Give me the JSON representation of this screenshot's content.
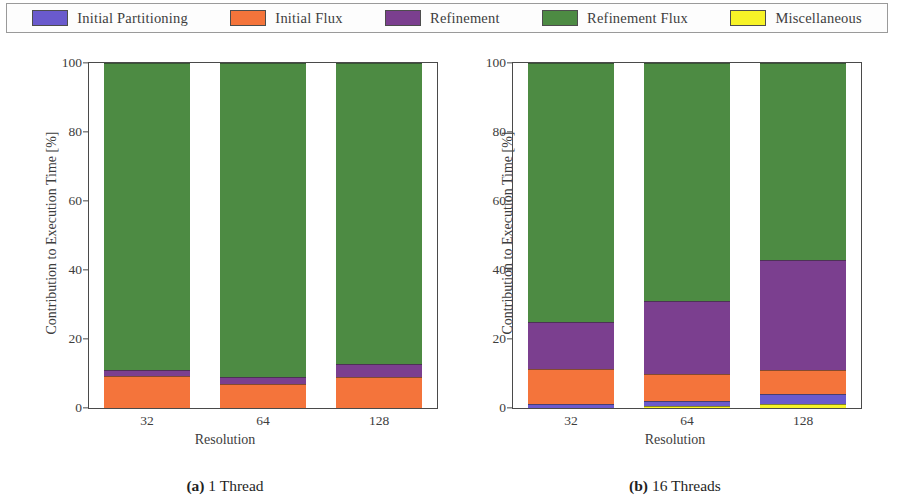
{
  "legend": {
    "items": [
      {
        "label": "Initial Partitioning",
        "color": "#6a5acd",
        "swatch_name": "legend-swatch-initial-partitioning"
      },
      {
        "label": "Initial Flux",
        "color": "#f4743b",
        "swatch_name": "legend-swatch-initial-flux"
      },
      {
        "label": "Refinement",
        "color": "#7b3f8f",
        "swatch_name": "legend-swatch-refinement"
      },
      {
        "label": "Refinement Flux",
        "color": "#4d8b43",
        "swatch_name": "legend-swatch-refinement-flux"
      },
      {
        "label": "Miscellaneous",
        "color": "#f7f327",
        "swatch_name": "legend-swatch-miscellaneous"
      }
    ]
  },
  "panels": [
    {
      "id": "a",
      "caption_tag": "(a)",
      "caption_text": "1 Thread",
      "ylabel": "Contribution to Execution Time [%]",
      "xlabel": "Resolution",
      "yticks": [
        "0",
        "20",
        "40",
        "60",
        "80",
        "100"
      ],
      "xticks": [
        "32",
        "64",
        "128"
      ]
    },
    {
      "id": "b",
      "caption_tag": "(b)",
      "caption_text": "16 Threads",
      "ylabel": "Contribution to Execution Time [%]",
      "xlabel": "Resolution",
      "yticks": [
        "0",
        "20",
        "40",
        "60",
        "80",
        "100"
      ],
      "xticks": [
        "32",
        "64",
        "128"
      ]
    }
  ],
  "chart_data": [
    {
      "type": "bar",
      "stacked": true,
      "title": "(a) 1 Thread",
      "xlabel": "Resolution",
      "ylabel": "Contribution to Execution Time [%]",
      "ylim": [
        0,
        100
      ],
      "yticks": [
        0,
        20,
        40,
        60,
        80,
        100
      ],
      "grid": false,
      "legend_position": "top",
      "categories": [
        "32",
        "64",
        "128"
      ],
      "series": [
        {
          "name": "Initial Partitioning",
          "color": "#6a5acd",
          "values": [
            0.0,
            0.0,
            0.0
          ]
        },
        {
          "name": "Initial Flux",
          "color": "#f4743b",
          "values": [
            9.2,
            6.9,
            8.9
          ]
        },
        {
          "name": "Refinement",
          "color": "#7b3f8f",
          "values": [
            1.7,
            2.0,
            3.8
          ]
        },
        {
          "name": "Refinement Flux",
          "color": "#4d8b43",
          "values": [
            89.1,
            91.1,
            87.3
          ]
        },
        {
          "name": "Miscellaneous",
          "color": "#f7f327",
          "values": [
            0.0,
            0.0,
            0.0
          ]
        }
      ]
    },
    {
      "type": "bar",
      "stacked": true,
      "title": "(b) 16 Threads",
      "xlabel": "Resolution",
      "ylabel": "Contribution to Execution Time [%]",
      "ylim": [
        0,
        100
      ],
      "yticks": [
        0,
        20,
        40,
        60,
        80,
        100
      ],
      "grid": false,
      "legend_position": "top",
      "categories": [
        "32",
        "64",
        "128"
      ],
      "series": [
        {
          "name": "Miscellaneous",
          "color": "#f7f327",
          "values": [
            0.0,
            0.6,
            1.2
          ]
        },
        {
          "name": "Initial Partitioning",
          "color": "#6a5acd",
          "values": [
            1.2,
            1.4,
            2.8
          ]
        },
        {
          "name": "Initial Flux",
          "color": "#f4743b",
          "values": [
            10.0,
            7.8,
            7.0
          ]
        },
        {
          "name": "Refinement",
          "color": "#7b3f8f",
          "values": [
            13.8,
            21.2,
            32.0
          ]
        },
        {
          "name": "Refinement Flux",
          "color": "#4d8b43",
          "values": [
            75.0,
            69.0,
            57.0
          ]
        }
      ]
    }
  ]
}
